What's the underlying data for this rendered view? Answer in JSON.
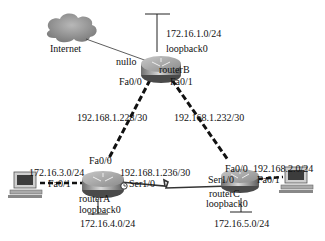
{
  "cloud": {
    "label": "Internet"
  },
  "routers": {
    "routerB": {
      "name": "routerB",
      "loopback_label": "loopback0",
      "loopback_net": "172.16.1.0/24",
      "if_internet": "nullo",
      "if_left": "Fa0/0",
      "if_right": "Fa0/1"
    },
    "routerA": {
      "name": "routerA",
      "loopback_label": "loopback0",
      "loopback_net": "172.16.4.0/24",
      "if_up": "Fa0/0",
      "if_lan": "Fa0/1",
      "if_serial": "Ser1/0",
      "lan_net": "172.16.3.0/24"
    },
    "routerC": {
      "name": "routerC",
      "loopback_label": "loopback0",
      "loopback_net": "172.16.5.0/24",
      "if_up": "Fa0/0",
      "if_lan": "Fa0/1",
      "if_serial": "Ser1/0",
      "lan_net": "192.168.2.0/24"
    }
  },
  "links": {
    "a_b": "192.168.1.228/30",
    "b_c": "192.168.1.232/30",
    "a_c": "192.168.1.236/30"
  }
}
